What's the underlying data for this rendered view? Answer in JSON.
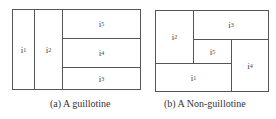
{
  "figures": [
    {
      "id": "a",
      "caption": "(a) A guillotine",
      "cells": [
        {
          "label": "i",
          "sub": "1"
        },
        {
          "label": "i",
          "sub": "2"
        },
        {
          "label": "i",
          "sub": "5"
        },
        {
          "label": "i",
          "sub": "4"
        },
        {
          "label": "i",
          "sub": "3"
        }
      ]
    },
    {
      "id": "b",
      "caption": "(b) A Non-guillotine",
      "cells": [
        {
          "label": "i",
          "sub": "2"
        },
        {
          "label": "i",
          "sub": "3"
        },
        {
          "label": "i",
          "sub": "5"
        },
        {
          "label": "i",
          "sub": "1"
        },
        {
          "label": "i",
          "sub": "4"
        }
      ]
    }
  ]
}
